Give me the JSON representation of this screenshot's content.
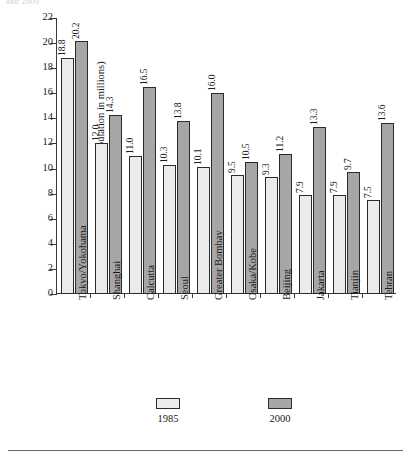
{
  "figure": {
    "cut_header_text": "and 2000",
    "y_axis_title": "(Population in millions)"
  },
  "legend": {
    "position": "bottom",
    "entries": [
      {
        "label": "1985",
        "swatch": "light",
        "color": "#ebebeb"
      },
      {
        "label": "2000",
        "swatch": "dark",
        "color": "#a6a6a6"
      }
    ]
  },
  "chart_data": {
    "type": "bar",
    "title": "",
    "subtitle": "",
    "xlabel": "",
    "ylabel": "(Population in millions)",
    "ylim": [
      0,
      22
    ],
    "ytick_step": 2,
    "yticks": [
      0,
      2,
      4,
      6,
      8,
      10,
      12,
      14,
      16,
      18,
      20,
      22
    ],
    "ytick_labels": [
      "0",
      "2",
      "4",
      "6",
      "8",
      "10",
      "12",
      "14",
      "16",
      "18",
      "20",
      "22"
    ],
    "grid": false,
    "legend_position": "bottom",
    "categories": [
      "Tokyo/Yokohama",
      "Shanghai",
      "Calcutta",
      "Seoul",
      "Greater Bombay",
      "Osaka/Kobe",
      "Beijing",
      "Jakarta",
      "Tianjin",
      "Tehran"
    ],
    "series": [
      {
        "name": "1985",
        "color": "#ebebeb",
        "values": [
          18.8,
          12.0,
          11.0,
          10.3,
          10.1,
          9.5,
          9.3,
          7.9,
          7.9,
          7.5
        ],
        "labels": [
          "18.8",
          "12.0",
          "11.0",
          "10.3",
          "10.1",
          "9.5",
          "9.3",
          "7.9",
          "7.9",
          "7.5"
        ]
      },
      {
        "name": "2000",
        "color": "#a6a6a6",
        "values": [
          20.2,
          14.3,
          16.5,
          13.8,
          16.0,
          10.5,
          11.2,
          13.3,
          9.7,
          13.6
        ],
        "labels": [
          "20.2",
          "14.3",
          "16.5",
          "13.8",
          "16.0",
          "10.5",
          "11.2",
          "13.3",
          "9.7",
          "13.6"
        ]
      }
    ]
  }
}
